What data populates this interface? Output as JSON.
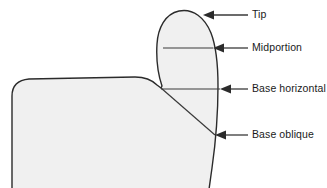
{
  "figure": {
    "colors": {
      "outline": "#2b2b2b",
      "fill": "#f0f0f0",
      "leader": "#3a3a3a",
      "text": "#1a1a1a",
      "background": "#ffffff"
    },
    "annotations": [
      {
        "id": "tip",
        "label": "Tip",
        "arrow_tip_x": 203,
        "arrow_tip_y": 15,
        "leader_end_x": 248,
        "text_x": 252,
        "text_y": 15
      },
      {
        "id": "midportion",
        "label": "Midportion",
        "arrow_tip_x": 213,
        "arrow_tip_y": 48,
        "leader_end_x": 248,
        "text_x": 252,
        "text_y": 48
      },
      {
        "id": "base-horizontal",
        "label": "Base horizontal",
        "arrow_tip_x": 220,
        "arrow_tip_y": 89,
        "leader_end_x": 248,
        "text_x": 252,
        "text_y": 89
      },
      {
        "id": "base-oblique",
        "label": "Base oblique",
        "arrow_tip_x": 215,
        "arrow_tip_y": 135,
        "leader_end_x": 248,
        "text_x": 252,
        "text_y": 135
      }
    ],
    "internal_lines": [
      {
        "id": "midportion-line",
        "x1": 163,
        "y1": 48,
        "x2": 213,
        "y2": 48
      },
      {
        "id": "base-horizontal-line",
        "x1": 161,
        "y1": 89,
        "x2": 220,
        "y2": 89
      },
      {
        "id": "base-oblique-line",
        "x1": 161,
        "y1": 88,
        "x2": 215,
        "y2": 135
      }
    ]
  }
}
